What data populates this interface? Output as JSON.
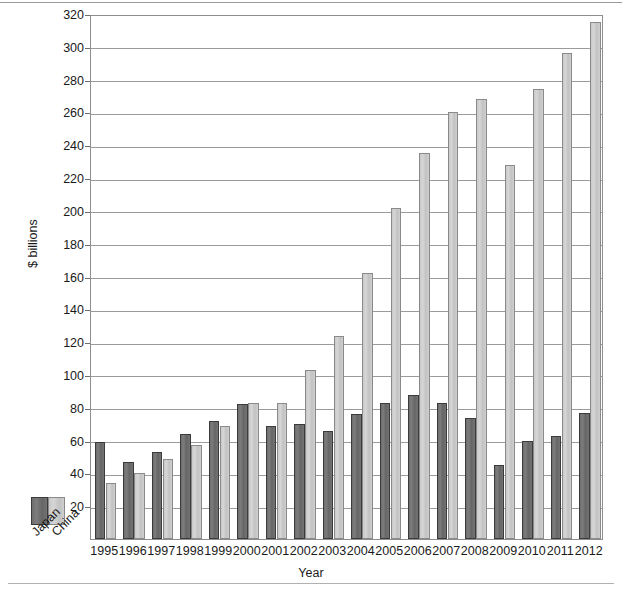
{
  "chart_data": {
    "type": "bar",
    "title": "",
    "xlabel": "Year",
    "ylabel": "$ billions",
    "ylim": [
      0,
      320
    ],
    "ytick_step": 20,
    "yticks": [
      20,
      40,
      60,
      80,
      100,
      120,
      140,
      160,
      180,
      200,
      220,
      240,
      260,
      280,
      300,
      320
    ],
    "grid": true,
    "legend_position": "bottom-left-outside",
    "categories": [
      "1995",
      "1996",
      "1997",
      "1998",
      "1999",
      "2000",
      "2001",
      "2002",
      "2003",
      "2004",
      "2005",
      "2006",
      "2007",
      "2008",
      "2009",
      "2010",
      "2011",
      "2012"
    ],
    "series": [
      {
        "name": "Japan",
        "color": "#6e6e6e",
        "values": [
          59,
          47,
          53,
          64,
          72,
          82,
          69,
          70,
          66,
          76,
          83,
          88,
          83,
          74,
          45,
          60,
          63,
          77
        ]
      },
      {
        "name": "China",
        "color": "#cccccc",
        "values": [
          34,
          40,
          49,
          57,
          69,
          83,
          83,
          103,
          124,
          162,
          202,
          235,
          260,
          268,
          228,
          274,
          296,
          315
        ]
      }
    ]
  },
  "axes": {
    "y_label": "$ billions",
    "x_label": "Year"
  },
  "legend": {
    "items": [
      {
        "label": "Japan",
        "swatch": "dark-gray-swatch"
      },
      {
        "label": "China",
        "swatch": "light-gray-swatch"
      }
    ]
  }
}
